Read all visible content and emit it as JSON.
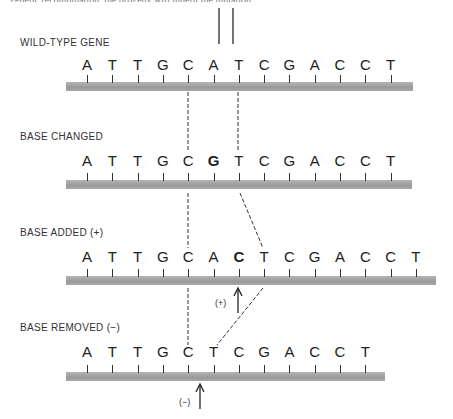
{
  "header": {
    "cut_off_text": "genetic recombination, the progeny will inherit the mutation ..."
  },
  "rows": [
    {
      "label": "WILD-TYPE GENE",
      "bases": [
        "A",
        "T",
        "T",
        "G",
        "C",
        "A",
        "T",
        "C",
        "G",
        "A",
        "C",
        "C",
        "T"
      ],
      "bold_index": -1
    },
    {
      "label": "BASE CHANGED",
      "bases": [
        "A",
        "T",
        "T",
        "G",
        "C",
        "G",
        "T",
        "C",
        "G",
        "A",
        "C",
        "C",
        "T"
      ],
      "bold_index": 5
    },
    {
      "label": "BASE ADDED (+)",
      "bases": [
        "A",
        "T",
        "T",
        "G",
        "C",
        "A",
        "C",
        "T",
        "C",
        "G",
        "A",
        "C",
        "C",
        "T"
      ],
      "bold_index": 6
    },
    {
      "label": "BASE REMOVED (−)",
      "bases": [
        "A",
        "T",
        "T",
        "G",
        "C",
        "T",
        "C",
        "G",
        "A",
        "C",
        "C",
        "T"
      ],
      "bold_index": -1
    }
  ],
  "markers": {
    "added": "(+)",
    "removed": "(−)"
  },
  "colors": {
    "bar": "#a8a8a8",
    "ink": "#222222"
  }
}
